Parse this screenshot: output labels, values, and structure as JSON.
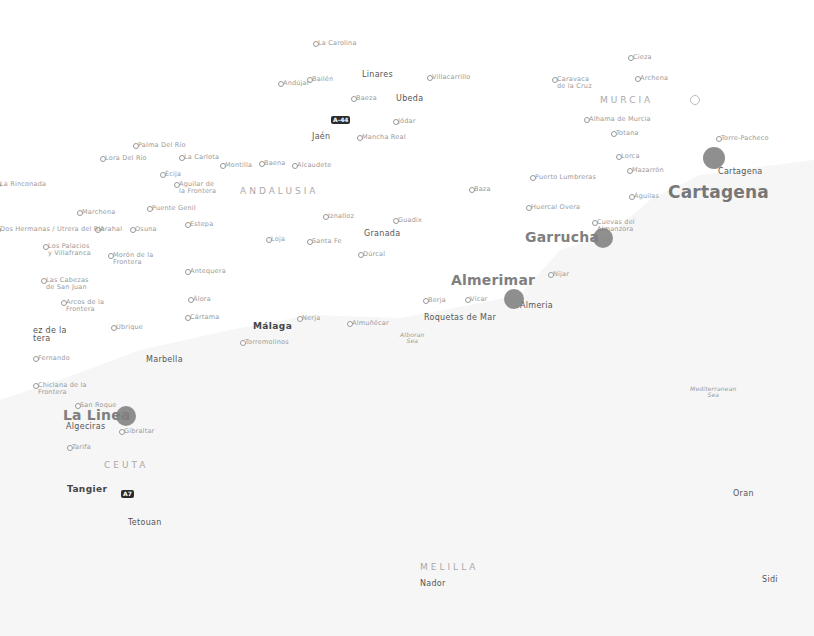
{
  "map": {
    "background": "#ffffff",
    "bubble_color": "#7b7b7b",
    "regions": [
      {
        "name": "ANDALUSIA",
        "x": 240,
        "y": 187
      },
      {
        "name": "MURCIA",
        "x": 600,
        "y": 96
      },
      {
        "name": "CEUTA",
        "x": 104,
        "y": 461
      },
      {
        "name": "MELILLA",
        "x": 420,
        "y": 563
      }
    ],
    "seas": [
      {
        "name": "Alboran\nSea",
        "x": 400,
        "y": 332
      },
      {
        "name": "Mediterranean\nSea",
        "x": 690,
        "y": 386
      }
    ],
    "bubbles": [
      {
        "label": "Cartagena",
        "x": 714,
        "y": 158,
        "r": 11,
        "label_x": 668,
        "label_y": 184,
        "big": true
      },
      {
        "label": "Garrucha",
        "x": 603,
        "y": 238,
        "r": 10,
        "label_x": 525,
        "label_y": 230,
        "big": false
      },
      {
        "label": "Almerimar",
        "x": 514,
        "y": 299,
        "r": 10,
        "label_x": 451,
        "label_y": 273,
        "big": false
      },
      {
        "label": "La Linea",
        "x": 126,
        "y": 416,
        "r": 10,
        "label_x": 63,
        "label_y": 408,
        "big": false
      }
    ],
    "shields": [
      {
        "label": "A-44",
        "x": 331,
        "y": 116
      },
      {
        "label": "A7",
        "x": 121,
        "y": 490
      }
    ],
    "cities": [
      {
        "name": "Jaén",
        "x": 312,
        "y": 133,
        "cls": "city2"
      },
      {
        "name": "Granada",
        "x": 364,
        "y": 230,
        "cls": "city2"
      },
      {
        "name": "Málaga",
        "x": 253,
        "y": 322,
        "cls": "city"
      },
      {
        "name": "Marbella",
        "x": 146,
        "y": 356,
        "cls": "city2"
      },
      {
        "name": "Algeciras",
        "x": 66,
        "y": 423,
        "cls": "city2"
      },
      {
        "name": "Tangier",
        "x": 67,
        "y": 485,
        "cls": "city"
      },
      {
        "name": "Tetouan",
        "x": 128,
        "y": 519,
        "cls": "city2"
      },
      {
        "name": "Almeria",
        "x": 520,
        "y": 302,
        "cls": "city2"
      },
      {
        "name": "Cartagena",
        "x": 718,
        "y": 168,
        "cls": "city2"
      },
      {
        "name": "Oran",
        "x": 733,
        "y": 490,
        "cls": "city2"
      },
      {
        "name": "Nador",
        "x": 420,
        "y": 580,
        "cls": "city2"
      },
      {
        "name": "Sidi",
        "x": 762,
        "y": 576,
        "cls": "city2"
      },
      {
        "name": "Linares",
        "x": 362,
        "y": 71,
        "cls": "city2"
      },
      {
        "name": "Ubeda",
        "x": 396,
        "y": 95,
        "cls": "city2"
      },
      {
        "name": "Roquetas de Mar",
        "x": 424,
        "y": 314,
        "cls": "city2"
      },
      {
        "name": "ez de la\ntera",
        "x": 33,
        "y": 327,
        "cls": "city2"
      }
    ],
    "towns": [
      {
        "name": "La Carolina",
        "x": 318,
        "y": 40
      },
      {
        "name": "Bailén",
        "x": 312,
        "y": 76
      },
      {
        "name": "Andújar",
        "x": 283,
        "y": 80
      },
      {
        "name": "Villacarrillo",
        "x": 432,
        "y": 74
      },
      {
        "name": "Baeza",
        "x": 356,
        "y": 95
      },
      {
        "name": "Jódar",
        "x": 398,
        "y": 118
      },
      {
        "name": "Mancha Real",
        "x": 362,
        "y": 134
      },
      {
        "name": "Cieza",
        "x": 633,
        "y": 54
      },
      {
        "name": "Caravaca\nde la Cruz",
        "x": 557,
        "y": 76
      },
      {
        "name": "Archena",
        "x": 640,
        "y": 75
      },
      {
        "name": "Alhama de Murcia",
        "x": 589,
        "y": 116
      },
      {
        "name": "Totana",
        "x": 616,
        "y": 130
      },
      {
        "name": "Torre-Pacheco",
        "x": 721,
        "y": 135
      },
      {
        "name": "Lorca",
        "x": 621,
        "y": 153
      },
      {
        "name": "Mazarrón",
        "x": 632,
        "y": 167
      },
      {
        "name": "Puerto Lumbreras",
        "x": 535,
        "y": 174
      },
      {
        "name": "Águilas",
        "x": 634,
        "y": 193
      },
      {
        "name": "Huercal Overa",
        "x": 531,
        "y": 204
      },
      {
        "name": "Cuevas del\nAlmanzora",
        "x": 597,
        "y": 219
      },
      {
        "name": "Baza",
        "x": 474,
        "y": 186
      },
      {
        "name": "Guadix",
        "x": 398,
        "y": 217
      },
      {
        "name": "Iznalloz",
        "x": 328,
        "y": 213
      },
      {
        "name": "Santa Fe",
        "x": 312,
        "y": 238
      },
      {
        "name": "Loja",
        "x": 271,
        "y": 236
      },
      {
        "name": "Dúrcal",
        "x": 363,
        "y": 251
      },
      {
        "name": "Níjar",
        "x": 553,
        "y": 271
      },
      {
        "name": "Berja",
        "x": 428,
        "y": 297
      },
      {
        "name": "Vícar",
        "x": 470,
        "y": 296
      },
      {
        "name": "Nerja",
        "x": 302,
        "y": 315
      },
      {
        "name": "Almuñécar",
        "x": 352,
        "y": 320
      },
      {
        "name": "Torremolinos",
        "x": 245,
        "y": 339
      },
      {
        "name": "Cártama",
        "x": 190,
        "y": 314
      },
      {
        "name": "Álora",
        "x": 193,
        "y": 296
      },
      {
        "name": "Antequera",
        "x": 190,
        "y": 268
      },
      {
        "name": "Palma Del Río",
        "x": 138,
        "y": 142
      },
      {
        "name": "Lora Del Río",
        "x": 105,
        "y": 155
      },
      {
        "name": "La Carlota",
        "x": 184,
        "y": 154
      },
      {
        "name": "Montilla",
        "x": 225,
        "y": 162
      },
      {
        "name": "Baena",
        "x": 264,
        "y": 160
      },
      {
        "name": "Alcaudete",
        "x": 297,
        "y": 162
      },
      {
        "name": "Écija",
        "x": 165,
        "y": 171
      },
      {
        "name": "Aguilar de\nla Frontera",
        "x": 179,
        "y": 181
      },
      {
        "name": "La Rinconada",
        "x": 0,
        "y": 181
      },
      {
        "name": "Marchena",
        "x": 82,
        "y": 209
      },
      {
        "name": "Puente Genil",
        "x": 152,
        "y": 205
      },
      {
        "name": "Estepa",
        "x": 190,
        "y": 221
      },
      {
        "name": "Arahal",
        "x": 100,
        "y": 226
      },
      {
        "name": "Osuna",
        "x": 135,
        "y": 226
      },
      {
        "name": "Dos Hermanas / Utrera del Río",
        "x": 0,
        "y": 226
      },
      {
        "name": "Los Palacios\ny Villafranca",
        "x": 48,
        "y": 243
      },
      {
        "name": "Morón de la\nFrontera",
        "x": 113,
        "y": 252
      },
      {
        "name": "Las Cabezas\nde San Juan",
        "x": 46,
        "y": 277
      },
      {
        "name": "Arcos de la\nFrontera",
        "x": 66,
        "y": 299
      },
      {
        "name": "Ubrique",
        "x": 116,
        "y": 324
      },
      {
        "name": "Fernando",
        "x": 38,
        "y": 355
      },
      {
        "name": "Chiclana de la\nFrontera",
        "x": 38,
        "y": 382
      },
      {
        "name": "San Roque",
        "x": 80,
        "y": 402
      },
      {
        "name": "Gibraltar",
        "x": 124,
        "y": 428
      },
      {
        "name": "Tarifa",
        "x": 72,
        "y": 444
      }
    ]
  }
}
